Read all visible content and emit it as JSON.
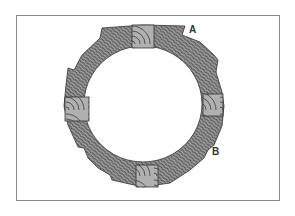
{
  "diagram": {
    "type": "segmented wooden ring cross-section",
    "labels": [
      {
        "id": "A",
        "text": "A"
      },
      {
        "id": "B",
        "text": "B"
      }
    ],
    "blocks": [
      "top",
      "left",
      "right",
      "bottom"
    ],
    "colors": {
      "ring_fill": "#9a9a9a",
      "grain_line": "#2a2a2a",
      "block_fill": "#a8a8a8",
      "frame_border": "#8a8a8a",
      "background": "#ffffff"
    }
  }
}
